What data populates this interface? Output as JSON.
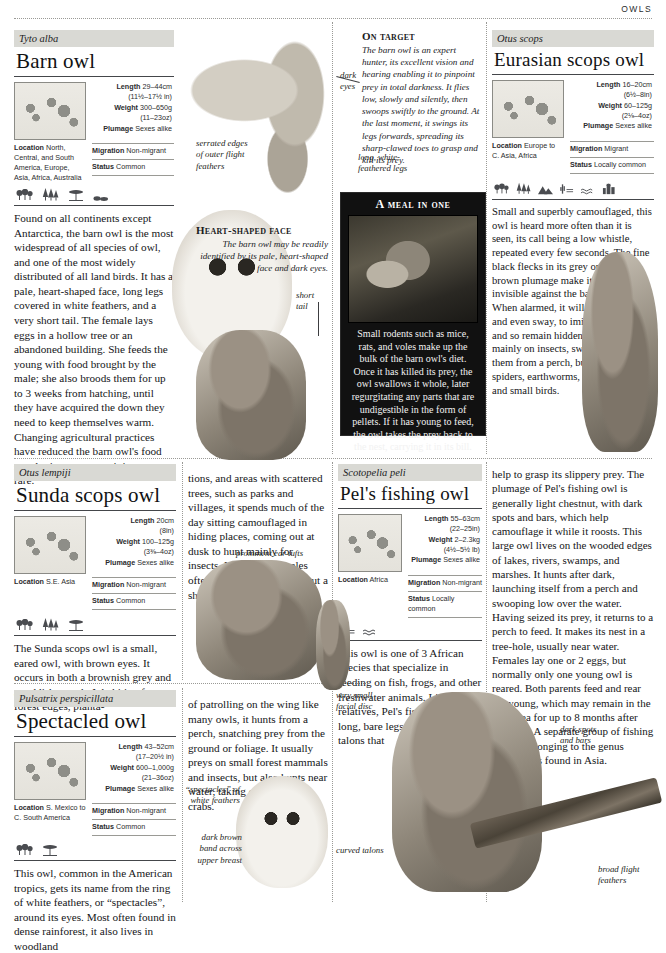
{
  "page": {
    "running_head": "OWLS"
  },
  "species": [
    {
      "id": "barn-owl",
      "scientific_name": "Tyto alba",
      "common_name": "Barn owl",
      "length_metric": "29–44cm",
      "length_imperial": "(11½–17½ in)",
      "weight_metric": "300–650g",
      "weight_imperial": "(11–23oz)",
      "plumage_label": "Plumage",
      "plumage": "Sexes alike",
      "length_label": "Length",
      "weight_label": "Weight",
      "location_label": "Location",
      "location": "North, Central, and South America, Europe, Asia, Africa, Australia",
      "migration_label": "Migration",
      "migration": "Non-migrant",
      "status_label": "Status",
      "status": "Common",
      "habitat_icons": [
        "broadleaf-forest-icon",
        "conifer-forest-icon",
        "savanna-icon",
        "scrub-icon"
      ],
      "body": "Found on all continents except Antarctica, the barn owl is the most widespread of all species of owl, and one of the most widely distributed of all land birds. It has a pale, heart-shaped face, long legs covered in white feathers, and a very short tail. The female lays eggs in a hollow tree or an abandoned building. She feeds the young with food brought by the male; she also broods them for up to 3 weeks from hatching, until they have acquired the down they need to keep themselves warm. Changing agricultural practices have reduced the barn owl's food supply; in some areas it is now rare."
    },
    {
      "id": "eurasian-scops-owl",
      "scientific_name": "Otus scops",
      "common_name": "Eurasian scops owl",
      "length_label": "Length",
      "length_metric": "16–20cm",
      "length_imperial": "(6½–8in)",
      "weight_label": "Weight",
      "weight_metric": "60–125g",
      "weight_imperial": "(2⅛–4oz)",
      "plumage_label": "Plumage",
      "plumage": "Sexes alike",
      "location_label": "Location",
      "location": "Europe to C. Asia, Africa",
      "migration_label": "Migration",
      "migration": "Migrant",
      "status_label": "Status",
      "status": "Locally common",
      "habitat_icons": [
        "broadleaf-forest-icon",
        "conifer-forest-icon",
        "mountain-icon",
        "desert-icon",
        "wetland-icon",
        "urban-icon"
      ],
      "body": "Small and superbly camouflaged, this owl is heard more often than it is seen, its call being a low whistle, repeated every few seconds. The fine black flecks in its grey or reddish brown plumage make it almost invisible against the bark of a tree. When alarmed, it will stretch itself, and even sway, to imitate a branch and so remain hidden. This owl feeds mainly on insects, swooping down on them from a perch, but also eats spiders, earthworms, reptiles, bats, and small birds."
    },
    {
      "id": "sunda-scops-owl",
      "scientific_name": "Otus lempiji",
      "common_name": "Sunda scops owl",
      "length_label": "Length",
      "length_metric": "20cm",
      "length_imperial": "(8in)",
      "weight_label": "Weight",
      "weight_metric": "100–125g",
      "weight_imperial": "(3⅜–4oz)",
      "plumage_label": "Plumage",
      "plumage": "Sexes alike",
      "location_label": "Location",
      "location": "S.E. Asia",
      "migration_label": "Migration",
      "migration": "Non-migrant",
      "status_label": "Status",
      "status": "Common",
      "habitat_icons": [
        "broadleaf-forest-icon",
        "conifer-forest-icon",
        "savanna-icon"
      ],
      "body_left": "The Sunda scops owl is a small, eared owl, with brown eyes. It occurs in both a brownish grey and a reddish morph. Inhabiting forests, forest edges, planta-",
      "body_right": "tions, and areas with scattered trees, such as parks and villages, it spends much of the day sitting camouflaged in hiding places, coming out at dusk to hunt mainly for insects. Males and females often call together, giving out a short, mellow hooting call."
    },
    {
      "id": "pels-fishing-owl",
      "scientific_name": "Scotopelia peli",
      "common_name": "Pel's fishing owl",
      "length_label": "Length",
      "length_metric": "55–63cm",
      "length_imperial": "(22–25in)",
      "weight_label": "Weight",
      "weight_metric": "2–2.3kg",
      "weight_imperial": "(4½–5½ lb)",
      "plumage_label": "Plumage",
      "plumage": "Sexes alike",
      "location_label": "Location",
      "location": "Africa",
      "migration_label": "Migration",
      "migration": "Non-migrant",
      "status_label": "Status",
      "status": "Locally common",
      "habitat_icons": [
        "riverbank-icon",
        "wetland-icon"
      ],
      "body_left": "This owl is one of 3 African species that specialize in feeding on fish, frogs, and other freshwater animals. Like its relatives, Pel's fishing owl has long, bare legs and curved talons that",
      "body_right": "help to grasp its slippery prey. The plumage of Pel's fishing owl is generally light chestnut, with dark spots and bars, which help camouflage it while it roosts. This large owl lives on the wooded edges of lakes, rivers, swamps, and marshes. It hunts after dark, launching itself from a perch and swooping low over the water. Having seized its prey, it returns to a perch to feed. It makes its nest in a tree-hole, usually near water. Females lay one or 2 eggs, but normally only one young owl is reared. Both parents feed and rear the young, which may remain in the nest area for up to 8 months after fledging. A separate group of fishing owls – belonging to the genus Ketupa – is found in Asia."
    },
    {
      "id": "spectacled-owl",
      "scientific_name": "Pulsatrix perspicillata",
      "common_name": "Spectacled owl",
      "length_label": "Length",
      "length_metric": "43–52cm",
      "length_imperial": "(17–20½ in)",
      "weight_label": "Weight",
      "weight_metric": "600–1,000g",
      "weight_imperial": "(21–36oz)",
      "plumage_label": "Plumage",
      "plumage": "Sexes alike",
      "location_label": "Location",
      "location": "S. Mexico to C. South America",
      "migration_label": "Migration",
      "migration": "Non-migrant",
      "status_label": "Status",
      "status": "Common",
      "habitat_icons": [
        "broadleaf-forest-icon",
        "savanna-icon"
      ],
      "body_left": "This owl, common in the American tropics, gets its name from the ring of white feathers, or “spectacles”, around its eyes. Most often found in dense rainforest, it also lives in woodland",
      "body_right": "of patrolling on the wing like many owls, it hunts from a perch, snatching prey from the ground or foliage. It usually preys on small forest mammals and insects, but also hunts near water, taking crawfish and crabs."
    }
  ],
  "features": [
    {
      "id": "on-target",
      "title": "On target",
      "body": "The barn owl is an expert hunter, its excellent vision and hearing enabling it to pinpoint prey in total darkness. It flies low, slowly and silently, then swoops swiftly to the ground. At the last moment, it swings its legs forwards, spreading its sharp-clawed toes to grasp and kill its prey."
    },
    {
      "id": "heart-shaped-face",
      "title": "Heart-shaped face",
      "body": "The barn owl may be readily identified by its pale, heart-shaped face and dark eyes."
    }
  ],
  "meal_box": {
    "title": "A meal in one",
    "caption": "Small rodents such as mice, rats, and voles make up the bulk of the barn owl's diet. Once it has killed its prey, the owl swallows it whole, later regurgitating any parts that are undigestible in the form of pellets. If it has young to feed, the owl takes the prey back to the nest, carrying it in its bill."
  },
  "callouts": [
    {
      "id": "dark-eyes",
      "text": "dark\neyes"
    },
    {
      "id": "serrated-edges",
      "text": "serrated edges\nof outer flight\nfeathers"
    },
    {
      "id": "long-white-feathered-legs",
      "text": "long, white-\nfeathered legs"
    },
    {
      "id": "short-tail",
      "text": "short\ntail"
    },
    {
      "id": "prominent-ear-tufts",
      "text": "prominent ear tufts"
    },
    {
      "id": "spectacles-white-feathers",
      "text": "“spectacles” of\nwhite feathers"
    },
    {
      "id": "dark-brown-band",
      "text": "dark brown\nband across\nupper breast"
    },
    {
      "id": "very-small-facial-disc",
      "text": "very small\nfacial disc"
    },
    {
      "id": "dark-spots-and-bars",
      "text": "dark spots\nand bars"
    },
    {
      "id": "curved-talons",
      "text": "curved talons"
    },
    {
      "id": "broad-flight-feathers",
      "text": "broad flight\nfeathers"
    }
  ]
}
